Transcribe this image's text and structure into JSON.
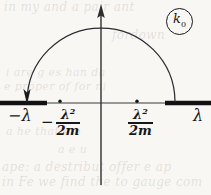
{
  "figure": {
    "kind": "complex-plane-contour-diagram",
    "caption_label": "k0",
    "annotation": {
      "symbol": "k",
      "subscript": "0",
      "shape": "circle"
    },
    "colors": {
      "background": "#f8f7f3",
      "ink": "#17161a",
      "axis": "#3a3a40",
      "branch_cut": "#111114",
      "bleed_text": "rgba(120,118,112,0.19)"
    },
    "axes": {
      "real_axis": {
        "y": 103,
        "x_start": 0,
        "x_end": 211,
        "arrow": "none"
      },
      "imaginary_axis": {
        "x": 101,
        "y_top": 6,
        "y_bottom": 185,
        "arrow": "up"
      }
    },
    "contour": {
      "type": "upper-half-plane-semicircle",
      "center_x": 101,
      "radius": 74,
      "apex_y": 26,
      "left_endpoint_x": 27,
      "right_endpoint_x": 175,
      "direction": "clockwise",
      "arrow_at": "left-endpoint",
      "arrow_direction": "down"
    },
    "branch_cuts": [
      {
        "name": "left-cut",
        "x_start": 0,
        "x_end": 47,
        "y": 103
      },
      {
        "name": "right-cut",
        "x_start": 165,
        "x_end": 211,
        "y": 103
      }
    ],
    "marked_points": [
      {
        "name": "left-pole",
        "x": 60,
        "y": 103
      },
      {
        "name": "right-pole",
        "x": 137,
        "y": 103
      }
    ],
    "labels": {
      "left_end": {
        "sign": "−",
        "symbol": "λ",
        "x": 10,
        "y": 107
      },
      "right_end": {
        "sign": "",
        "symbol": "λ",
        "x": 193,
        "y": 107
      },
      "left_fraction": {
        "sign": "−",
        "numerator": "λ",
        "numerator_exponent": "2",
        "denominator": "2m",
        "x": 43,
        "y": 108
      },
      "right_fraction": {
        "sign": "",
        "numerator": "λ",
        "numerator_exponent": "2",
        "denominator": "2m",
        "x": 127,
        "y": 108
      }
    },
    "bleed_through_text": [
      "in my and a pair ant",
      "fordown",
      "i are g es han da",
      "e proper of for ni",
      "a he that e o",
      "a e u",
      "ape: a destribut offer e ap",
      "in Fe we find the to gauge com"
    ]
  }
}
